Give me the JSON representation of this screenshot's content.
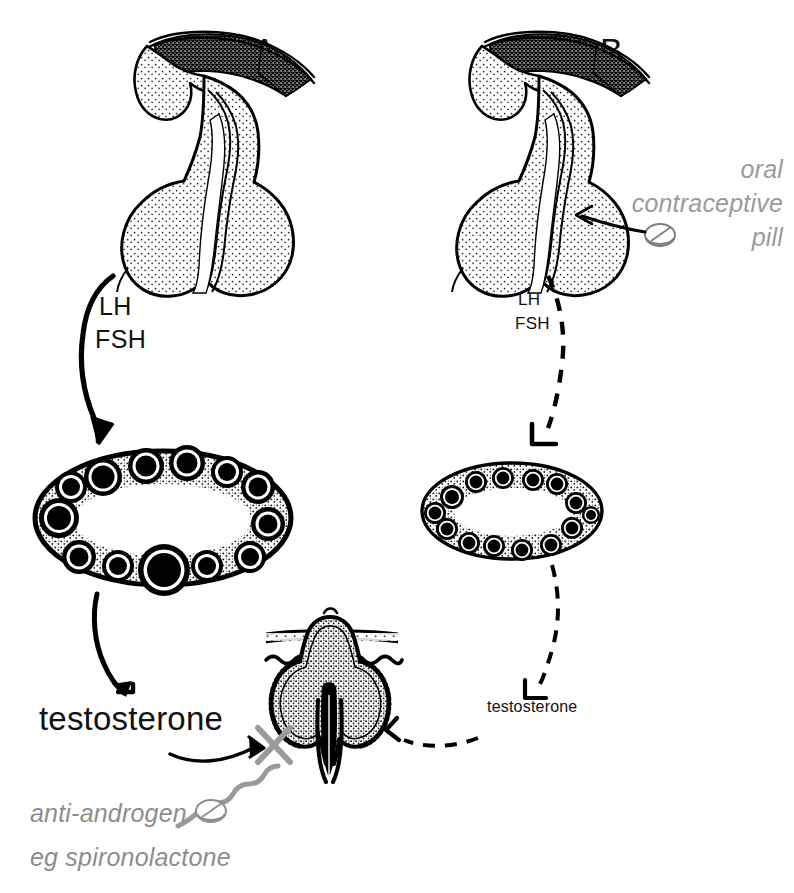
{
  "figure": {
    "background_color": "#ffffff",
    "ink_color": "#000000",
    "muted_color": "#8d8d8d",
    "width": 794,
    "height": 893
  },
  "panels": [
    {
      "id": "A",
      "letter": "A",
      "description": "Untreated polycystic ovary syndrome pathway",
      "line_style": "solid",
      "pituitary_label": "pituitary-gland",
      "hormones": {
        "line1": "LH",
        "line2": "FSH"
      },
      "ovary": {
        "name": "polycystic-ovary",
        "follicle_count": 13,
        "has_dominant_follicle": true,
        "size": "large"
      },
      "androgen_label": "testosterone"
    },
    {
      "id": "B",
      "letter": "B",
      "description": "Treated pathway with oral contraceptive pill suppressing gonadotrophins",
      "line_style": "dashed",
      "pituitary_label": "pituitary-gland",
      "hormones": {
        "line1": "LH",
        "line2": "FSH"
      },
      "ovary": {
        "name": "suppressed-ovary",
        "follicle_count": 14,
        "has_dominant_follicle": false,
        "size": "small"
      },
      "androgen_label": "testosterone"
    }
  ],
  "annotations": {
    "oral_contraceptive": {
      "line1": "oral",
      "line2": "contraceptive",
      "line3": "pill",
      "color": "#9a9a9a",
      "icon": "pill-icon"
    },
    "anti_androgen": {
      "line1": "anti-androgen",
      "line2": "eg spironolactone",
      "color": "#8d8d8d",
      "icon": "pill-icon",
      "blocked_marker": "x-block-icon"
    },
    "hair_follicle": {
      "name": "hair-follicle-cross-section",
      "description": "Skin with hair follicle target organ"
    }
  }
}
